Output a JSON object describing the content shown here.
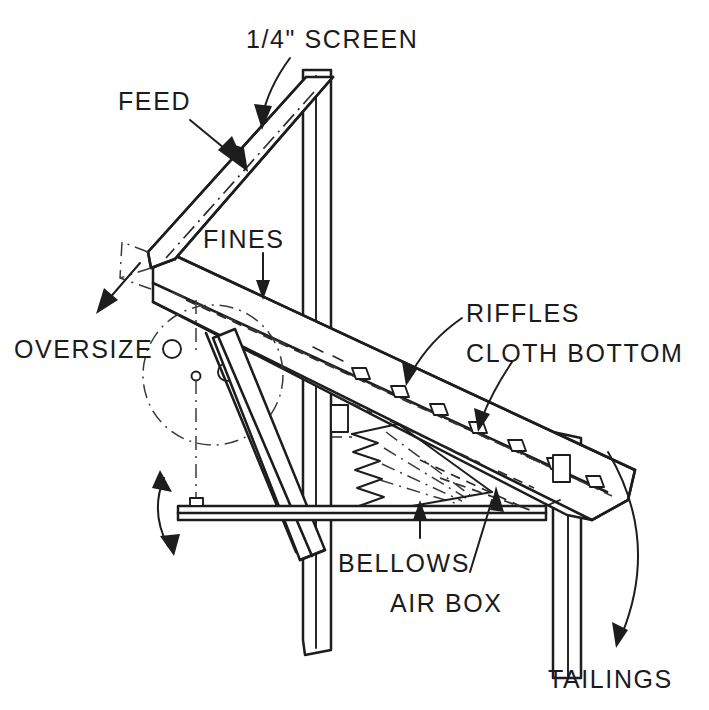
{
  "figure": {
    "title_label": "1/4\" SCREEN",
    "background_color": "#ffffff",
    "ink_color": "#1d1d1d"
  },
  "labels": {
    "screen": "1/4\" SCREEN",
    "feed": "FEED",
    "fines": "FINES",
    "oversize": "OVERSIZE",
    "riffles": "RIFFLES",
    "cloth_bottom": "CLOTH BOTTOM",
    "bellows": "BELLOWS",
    "air_box": "AIR BOX",
    "tailings": "TAILINGS"
  },
  "callouts": [
    {
      "name": "screen-callout",
      "text": "1/4\" SCREEN",
      "points_to": "upper inclined screen deck"
    },
    {
      "name": "feed-callout",
      "text": "FEED",
      "points_to": "top of inclined screen"
    },
    {
      "name": "fines-callout",
      "text": "FINES",
      "points_to": "material passing through screen"
    },
    {
      "name": "oversize-callout",
      "text": "OVERSIZE",
      "points_to": "discharge at lower left of screen"
    },
    {
      "name": "riffles-callout",
      "text": "RIFFLES",
      "points_to": "riffle bars on lower deck"
    },
    {
      "name": "cloth-bottom-callout",
      "text": "CLOTH BOTTOM",
      "points_to": "cloth deck surface"
    },
    {
      "name": "bellows-callout",
      "text": "BELLOWS",
      "points_to": "accordion bellows under deck"
    },
    {
      "name": "air-box-callout",
      "text": "AIR BOX",
      "points_to": "air plenum beneath deck"
    },
    {
      "name": "tailings-callout",
      "text": "TAILINGS",
      "points_to": "discharge end of lower deck"
    }
  ],
  "parts": [
    {
      "name": "upper-screen-deck",
      "kind": "inclined-screen"
    },
    {
      "name": "lower-deck",
      "kind": "inclined-jig-deck"
    },
    {
      "name": "vertical-post-left",
      "kind": "frame-leg"
    },
    {
      "name": "vertical-post-right",
      "kind": "frame-leg"
    },
    {
      "name": "base-beam",
      "kind": "horizontal-beam"
    },
    {
      "name": "eccentric-circle",
      "kind": "pivot-drive-circle"
    },
    {
      "name": "connecting-rod",
      "kind": "drive-linkage"
    },
    {
      "name": "bellows",
      "kind": "accordion-bellows"
    },
    {
      "name": "riffle-bars",
      "kind": "riffles",
      "count": 12
    },
    {
      "name": "oscillation-arrow",
      "kind": "double-headed-motion-arrow"
    }
  ]
}
